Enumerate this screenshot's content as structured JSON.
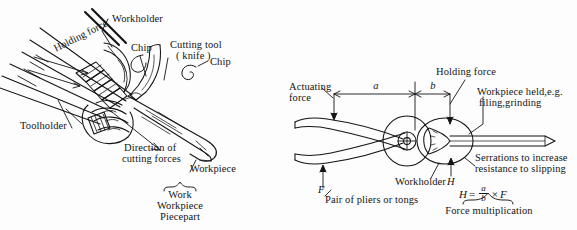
{
  "figure": {
    "background_color": "#fdfdfd",
    "ink_color": "#141414"
  },
  "left_panel": {
    "name": "hand-whittling-knife-diagram",
    "labels": {
      "workholder": "Workholder",
      "chip_top": "Chip",
      "cutting_tool_line1": "Cutting tool",
      "cutting_tool_line2": "( knife )",
      "chip_right": "Chip",
      "holding_force": "Holding force",
      "toolholder": "Toolholder",
      "direction_line1": "Direction of",
      "direction_line2": "cutting forces",
      "workpiece": "Workpiece",
      "brace_terms": [
        "Work",
        "Workpiece",
        "Piecepart"
      ]
    }
  },
  "right_panel": {
    "name": "pliers-force-multiplication-diagram",
    "labels": {
      "actuating_force_line1": "Actuating",
      "actuating_force_line2": "force",
      "dimension_a": "a",
      "dimension_b": "b",
      "holding_force": "Holding force",
      "workpiece_held_line1": "Workpiece held,e.g.",
      "workpiece_held_line2": "filing,grinding",
      "serrations_line1": "Serrations to increase",
      "serrations_line2": "resistance to slipping",
      "workholder": "Workholder",
      "workholder_symbol": "H",
      "force_symbol": "F",
      "pair_of_pliers": "Pair of pliers or tongs",
      "force_multiplication": "Force multiplication"
    },
    "formula": {
      "lhs": "H",
      "equals": "=",
      "numerator": "a",
      "denominator": "b",
      "times": "×",
      "rhs": "F"
    }
  }
}
